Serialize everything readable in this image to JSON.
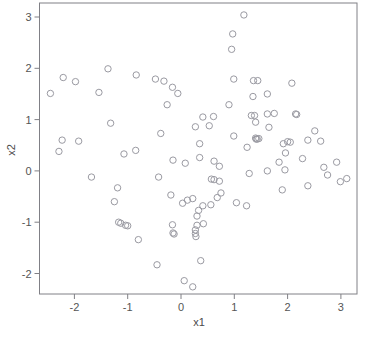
{
  "chart_data": {
    "type": "scatter",
    "title": "",
    "xlabel": "x1",
    "ylabel": "x2",
    "xlim": [
      -2.66,
      3.31
    ],
    "ylim": [
      -2.68,
      3.2
    ],
    "xticks": [
      -2,
      -1,
      0,
      1,
      2,
      3
    ],
    "xticklabels": [
      "-2",
      "-1",
      "0",
      "1",
      "2",
      "3"
    ],
    "yticks": [
      -2,
      -1,
      0,
      1,
      2,
      3
    ],
    "yticklabels": [
      "-2",
      "-1",
      "0",
      "1",
      "2",
      "3"
    ],
    "grid": false,
    "legend": null,
    "marker": "open-circle",
    "marker_color": "#9a9aa2",
    "marker_size": 4,
    "n_points": 120,
    "points": [
      [
        1.18,
        3.04
      ],
      [
        0.97,
        2.67
      ],
      [
        0.95,
        2.37
      ],
      [
        -1.37,
        1.99
      ],
      [
        -2.21,
        1.82
      ],
      [
        -1.98,
        1.74
      ],
      [
        -0.84,
        1.87
      ],
      [
        -0.48,
        1.79
      ],
      [
        -0.32,
        1.75
      ],
      [
        -0.16,
        1.63
      ],
      [
        -2.45,
        1.51
      ],
      [
        -1.54,
        1.53
      ],
      [
        0.99,
        1.79
      ],
      [
        1.36,
        1.76
      ],
      [
        1.44,
        1.76
      ],
      [
        2.08,
        1.71
      ],
      [
        1.62,
        1.5
      ],
      [
        1.35,
        1.45
      ],
      [
        -0.26,
        1.29
      ],
      [
        0.9,
        1.29
      ],
      [
        -0.06,
        1.51
      ],
      [
        2.15,
        1.11
      ],
      [
        2.17,
        1.1
      ],
      [
        1.75,
        1.12
      ],
      [
        1.62,
        1.11
      ],
      [
        1.38,
        1.08
      ],
      [
        1.32,
        1.08
      ],
      [
        0.41,
        1.05
      ],
      [
        0.61,
        1.06
      ],
      [
        -1.32,
        0.93
      ],
      [
        0.27,
        0.86
      ],
      [
        0.53,
        0.88
      ],
      [
        1.4,
        0.95
      ],
      [
        1.65,
        0.85
      ],
      [
        -0.38,
        0.73
      ],
      [
        0.99,
        0.68
      ],
      [
        1.46,
        0.63
      ],
      [
        1.43,
        0.62
      ],
      [
        1.41,
        0.62
      ],
      [
        1.4,
        0.64
      ],
      [
        2.51,
        0.78
      ],
      [
        2.38,
        0.6
      ],
      [
        2.62,
        0.58
      ],
      [
        2.0,
        0.57
      ],
      [
        2.05,
        0.56
      ],
      [
        1.92,
        0.53
      ],
      [
        0.35,
        0.53
      ],
      [
        1.24,
        0.46
      ],
      [
        -2.23,
        0.6
      ],
      [
        -1.92,
        0.58
      ],
      [
        -2.29,
        0.38
      ],
      [
        1.96,
        0.35
      ],
      [
        2.28,
        0.24
      ],
      [
        1.84,
        0.17
      ],
      [
        2.92,
        0.17
      ],
      [
        2.68,
        0.07
      ],
      [
        -0.15,
        0.21
      ],
      [
        0.08,
        0.15
      ],
      [
        0.35,
        0.26
      ],
      [
        0.62,
        0.19
      ],
      [
        -1.07,
        0.33
      ],
      [
        -0.85,
        0.4
      ],
      [
        0.72,
        0.09
      ],
      [
        1.28,
        -0.05
      ],
      [
        1.62,
        0.0
      ],
      [
        1.95,
        0.02
      ],
      [
        2.75,
        -0.08
      ],
      [
        3.11,
        -0.15
      ],
      [
        2.99,
        -0.21
      ],
      [
        -1.68,
        -0.12
      ],
      [
        -0.42,
        -0.12
      ],
      [
        0.57,
        -0.16
      ],
      [
        0.62,
        -0.17
      ],
      [
        0.72,
        -0.2
      ],
      [
        2.38,
        -0.29
      ],
      [
        -1.19,
        -0.33
      ],
      [
        1.9,
        -0.37
      ],
      [
        0.75,
        -0.43
      ],
      [
        -0.19,
        -0.47
      ],
      [
        0.68,
        -0.52
      ],
      [
        -1.25,
        -0.6
      ],
      [
        0.03,
        -0.63
      ],
      [
        0.12,
        -0.57
      ],
      [
        0.22,
        -0.54
      ],
      [
        0.41,
        -0.68
      ],
      [
        0.56,
        -0.66
      ],
      [
        1.04,
        -0.62
      ],
      [
        1.23,
        -0.68
      ],
      [
        0.33,
        -0.77
      ],
      [
        0.3,
        -0.88
      ],
      [
        -1.17,
        -1.0
      ],
      [
        -1.13,
        -1.02
      ],
      [
        -1.0,
        -1.07
      ],
      [
        -1.04,
        -1.06
      ],
      [
        -0.16,
        -1.05
      ],
      [
        0.42,
        -1.03
      ],
      [
        0.3,
        -1.06
      ],
      [
        -0.15,
        -1.21
      ],
      [
        -0.13,
        -1.23
      ],
      [
        0.27,
        -1.22
      ],
      [
        0.28,
        -1.28
      ],
      [
        0.27,
        -1.15
      ],
      [
        -0.8,
        -1.34
      ],
      [
        0.37,
        -1.75
      ],
      [
        -0.45,
        -1.83
      ],
      [
        0.06,
        -2.14
      ],
      [
        0.22,
        -2.26
      ]
    ]
  },
  "axes": {
    "x_title": "x1",
    "y_title": "x2",
    "frame_color": "#808086",
    "background": "#ffffff"
  }
}
